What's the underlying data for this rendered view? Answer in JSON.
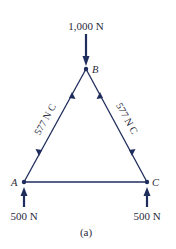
{
  "diagram": {
    "type": "truss-free-body",
    "nodes": [
      {
        "id": "A",
        "label": "A",
        "x": 24,
        "y": 182
      },
      {
        "id": "B",
        "label": "B",
        "x": 86,
        "y": 69
      },
      {
        "id": "C",
        "label": "C",
        "x": 147,
        "y": 182
      }
    ],
    "members": [
      {
        "from": "A",
        "to": "B",
        "label": "577 N C"
      },
      {
        "from": "B",
        "to": "C",
        "label": "577 N C"
      },
      {
        "from": "A",
        "to": "C",
        "label": ""
      }
    ],
    "loads": [
      {
        "node": "B",
        "label": "1,000 N",
        "direction": "down"
      },
      {
        "node": "A",
        "label": "500 N",
        "direction": "up"
      },
      {
        "node": "C",
        "label": "500 N",
        "direction": "up"
      }
    ],
    "caption": "(a)",
    "colors": {
      "line": "#1f2d5c",
      "text": "#2a2a3a"
    }
  }
}
